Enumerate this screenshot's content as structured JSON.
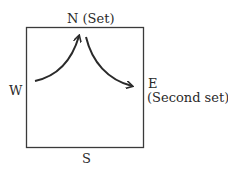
{
  "diagram": {
    "labels": {
      "north": "N (Set)",
      "west": "W",
      "east": "E",
      "east_note": "(Second set)",
      "south": "S"
    },
    "colors": {
      "line": "#2a2a2a",
      "background": "#ffffff"
    },
    "arrows": [
      {
        "from": "W",
        "to": "N",
        "description": "curved arrow from west rising to north"
      },
      {
        "from": "N",
        "to": "E",
        "description": "curved arrow from north descending to east"
      }
    ]
  }
}
